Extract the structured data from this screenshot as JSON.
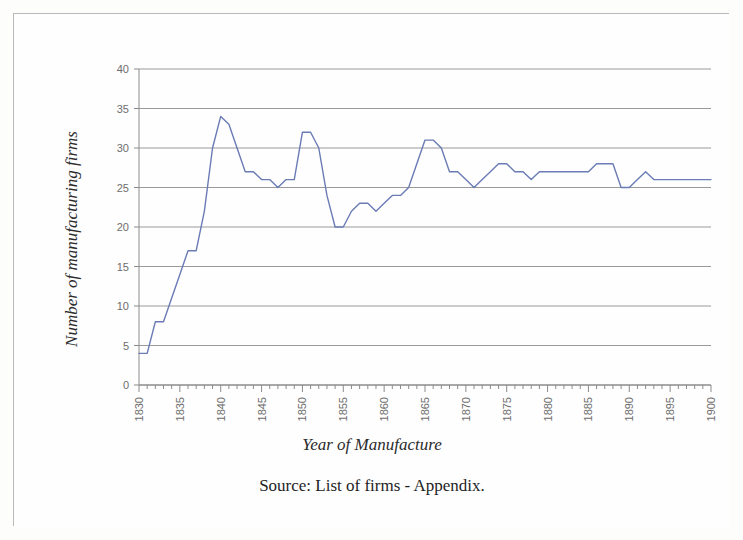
{
  "figure": {
    "border_color": "#b9b9b9",
    "background_color": "#fefefe",
    "source_note": "Source: List of firms - Appendix."
  },
  "chart_data": {
    "type": "line",
    "title": "",
    "xlabel": "Year of Manufacture",
    "ylabel": "Number of manufacturing firms",
    "xlim": [
      1830,
      1900
    ],
    "ylim": [
      0,
      40
    ],
    "ytick_step": 5,
    "xtick_step": 1,
    "xlabel_step": 5,
    "grid": "horizontal",
    "legend": "none",
    "line_color": "#6a7bb5",
    "line_width": 1.4,
    "ytick_labels": [
      "0",
      "5",
      "10",
      "15",
      "20",
      "25",
      "30",
      "35",
      "40"
    ],
    "ytick_values": [
      0,
      5,
      10,
      15,
      20,
      25,
      30,
      35,
      40
    ],
    "xtick_labels": [
      "1830",
      "1835",
      "1840",
      "1845",
      "1850",
      "1855",
      "1860",
      "1865",
      "1870",
      "1875",
      "1880",
      "1885",
      "1890",
      "1895",
      "1900"
    ],
    "xtick_values": [
      1830,
      1835,
      1840,
      1845,
      1850,
      1855,
      1860,
      1865,
      1870,
      1875,
      1880,
      1885,
      1890,
      1895,
      1900
    ],
    "x": [
      1830,
      1831,
      1832,
      1833,
      1834,
      1835,
      1836,
      1837,
      1838,
      1839,
      1840,
      1841,
      1842,
      1843,
      1844,
      1845,
      1846,
      1847,
      1848,
      1849,
      1850,
      1851,
      1852,
      1853,
      1854,
      1855,
      1856,
      1857,
      1858,
      1859,
      1860,
      1861,
      1862,
      1863,
      1864,
      1865,
      1866,
      1867,
      1868,
      1869,
      1870,
      1871,
      1872,
      1873,
      1874,
      1875,
      1876,
      1877,
      1878,
      1879,
      1880,
      1881,
      1882,
      1883,
      1884,
      1885,
      1886,
      1887,
      1888,
      1889,
      1890,
      1891,
      1892,
      1893,
      1894,
      1895,
      1896,
      1897,
      1898,
      1899,
      1900
    ],
    "values": [
      4,
      4,
      8,
      8,
      11,
      14,
      17,
      17,
      22,
      30,
      34,
      33,
      30,
      27,
      27,
      26,
      26,
      25,
      26,
      26,
      32,
      32,
      30,
      24,
      20,
      20,
      22,
      23,
      23,
      22,
      23,
      24,
      24,
      25,
      28,
      31,
      31,
      30,
      27,
      27,
      26,
      25,
      26,
      27,
      28,
      28,
      27,
      27,
      26,
      27,
      27,
      27,
      27,
      27,
      27,
      27,
      28,
      28,
      28,
      25,
      25,
      26,
      27,
      26,
      26,
      26,
      26,
      26,
      26,
      26,
      26
    ],
    "series_name": "Number of manufacturing firms"
  }
}
